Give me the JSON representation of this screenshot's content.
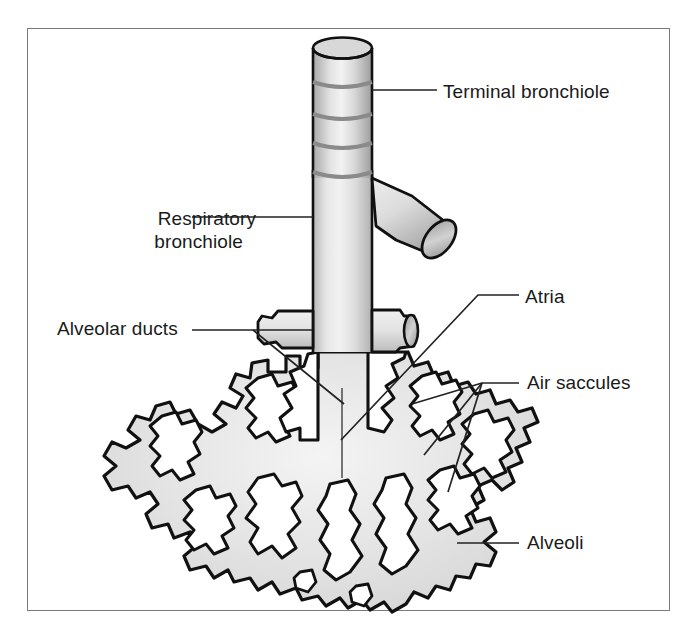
{
  "figure": {
    "background_color": "#ffffff",
    "border_color": "#7a7a7a",
    "outline_color": "#111111",
    "fill_color": "#e8e8e8",
    "text_color": "#1a1a1a"
  },
  "labels": {
    "terminal_bronchiole": "Terminal bronchiole",
    "respiratory_bronchiole_line1": "Respiratory",
    "respiratory_bronchiole_line2": "bronchiole",
    "alveolar_ducts": "Alveolar ducts",
    "atria": "Atria",
    "air_saccules": "Air saccules",
    "alveoli": "Alveoli"
  },
  "structures": {
    "terminal_bronchiole": "terminal-bronchiole-tube",
    "cartilage_rings": 4,
    "side_branch": "cut-branch-opening",
    "respiratory_bronchiole": "respiratory-bronchiole-trunk",
    "alveolar_duct_left_stub": "alveolar-duct-left",
    "alveolar_duct_right_stub": "alveolar-duct-right",
    "alveolar_sac_mass": "alveolar-sac-cluster"
  }
}
